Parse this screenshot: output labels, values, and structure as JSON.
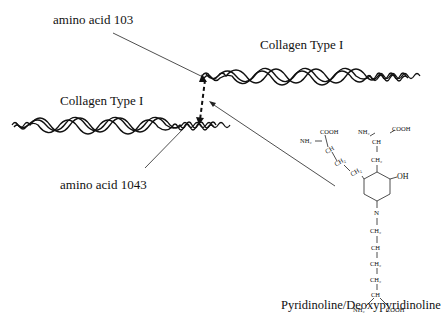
{
  "labels": {
    "amino_acid_top": "amino acid 103",
    "amino_acid_bottom": "amino acid 1043",
    "collagen_right": "Collagen Type I",
    "collagen_left": "Collagen Type I",
    "compound_name": "Pyridinoline/Deoxypyridinoline"
  },
  "chemistry": {
    "cooh_left": "COOH",
    "nh2_left": "NH₂",
    "ch_left": "CH",
    "ch2_a": "CH₂",
    "ch2_b": "CH₂",
    "nh2_right": "NH₂",
    "ch_right": "CH",
    "cooh_right": "COOH",
    "ch2_right": "CH₂",
    "oh": "OH",
    "n": "N",
    "chain": [
      "CH₂",
      "CH",
      "CH₂",
      "CH₂",
      "CH"
    ],
    "nh2_bottom": "NH₂",
    "cooh_bottom": "COOH"
  }
}
